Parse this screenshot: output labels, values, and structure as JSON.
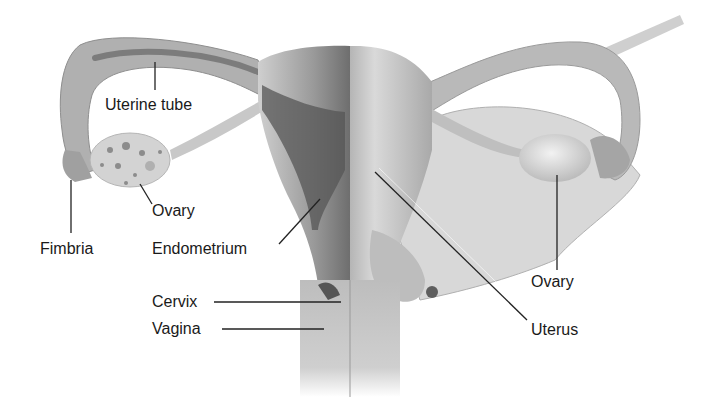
{
  "diagram": {
    "labels": {
      "uterine_tube": "Uterine tube",
      "ovary_left": "Ovary",
      "fimbria": "Fimbria",
      "endometrium": "Endometrium",
      "cervix": "Cervix",
      "vagina": "Vagina",
      "ovary_right": "Ovary",
      "uterus": "Uterus"
    },
    "colors": {
      "background": "#ffffff",
      "tissue_light": "#d6d6d6",
      "tissue_mid": "#a8a8a8",
      "tissue_dark": "#5a5a5a",
      "label_text": "#1a1a1a",
      "leader_line": "#222222"
    }
  }
}
